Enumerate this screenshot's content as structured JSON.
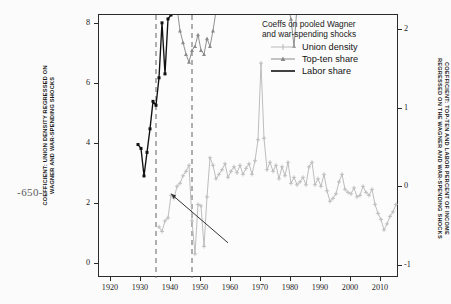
{
  "folio": {
    "page_number": "-650-"
  },
  "legend": {
    "title": "Coeffs on pooled Wagner\nand war-spending shocks",
    "entries": [
      {
        "label": "Union density",
        "color": "#b9b9b9",
        "marker": "plus-marker"
      },
      {
        "label": "Top-ten share",
        "color": "#8a8a8a",
        "marker": "triangle-marker"
      },
      {
        "label": "Labor share",
        "color": "#111111",
        "marker": "line-marker"
      }
    ]
  },
  "axes": {
    "left_title": "COEFFICIENT: UNION DENSITY REGRESSED ON\nWAGNER AND WAR-SPENDING SHOCKS",
    "right_title": "COEFFICIENT: TOP-TEN AND LABOR PERCENT OF INCOME\nREGRESSED ON THE WAGNER AND WAR-SPENDING SHOCKS",
    "left_ticks": [
      "0",
      "2",
      "4",
      "6",
      "8"
    ],
    "right_ticks": [
      "-1",
      "0",
      "1",
      "2"
    ],
    "x_ticks": [
      "1920",
      "1930",
      "1940",
      "1950",
      "1960",
      "1970",
      "1980",
      "1990",
      "2000",
      "2010"
    ]
  },
  "chart_data": {
    "type": "line",
    "title": "Coeffs on pooled Wagner and war-spending shocks",
    "xlabel": "",
    "ylabel": "COEFFICIENT: UNION DENSITY REGRESSED ON WAGNER AND WAR-SPENDING SHOCKS",
    "ylabel_right": "COEFFICIENT: TOP-TEN AND LABOR PERCENT OF INCOME REGRESSED ON THE WAGNER AND WAR-SPENDING SHOCKS",
    "xlim": [
      1916,
      2016
    ],
    "ylim": [
      -0.45,
      8.3
    ],
    "ylim_right": [
      -1.15,
      2.2
    ],
    "grid": false,
    "legend_position": "top-right",
    "annotations": [
      {
        "type": "vline",
        "x": 1935,
        "style": "dashed",
        "color": "#6e6e6e"
      },
      {
        "type": "vline",
        "x": 1947,
        "style": "dashed",
        "color": "#6e6e6e"
      },
      {
        "type": "arrow",
        "x_from": 1959,
        "y_from": 0.72,
        "x_to": 1940,
        "y_to": 2.35,
        "color": "#333333"
      }
    ],
    "series": [
      {
        "name": "Top-ten share",
        "axis": "right",
        "color": "#8a8a8a",
        "marker": "triangle",
        "x": [
          1918,
          1919,
          1920,
          1921,
          1922,
          1923,
          1924,
          1925,
          1926,
          1927,
          1928,
          1929,
          1930,
          1931,
          1932,
          1933,
          1934,
          1935,
          1936,
          1937,
          1938,
          1939,
          1940,
          1941,
          1942,
          1943,
          1944,
          1945,
          1946,
          1947,
          1948,
          1949,
          1950,
          1951,
          1952,
          1953,
          1954,
          1955,
          1956,
          1957,
          1958,
          1959,
          1960,
          1961,
          1962,
          1963,
          1964,
          1965,
          1966,
          1967,
          1968,
          1969,
          1970,
          1971,
          1972,
          1973,
          1974,
          1975,
          1976,
          1977,
          1978,
          1979,
          1980,
          1981,
          1982,
          1983,
          1984,
          1985,
          1986,
          1987,
          1988,
          1989,
          1990,
          1991,
          1992,
          1993,
          1994,
          1995,
          1996,
          1997,
          1998,
          1999,
          2000,
          2001,
          2002,
          2003,
          2004,
          2005,
          2006,
          2007,
          2008,
          2009,
          2010,
          2011,
          2012,
          2013,
          2014,
          2015
        ],
        "y": [
          7.45,
          7.2,
          7.15,
          5.05,
          5.5,
          4.55,
          6.5,
          6.45,
          6.4,
          6.6,
          6.75,
          7.95,
          6.1,
          5.3,
          5.6,
          6.15,
          5.85,
          6.7,
          6.4,
          5.85,
          5.2,
          4.35,
          4.15,
          3.0,
          2.3,
          2.0,
          1.85,
          1.7,
          1.6,
          1.75,
          1.8,
          1.95,
          1.75,
          1.7,
          1.9,
          1.8,
          2.0,
          2.25,
          2.35,
          2.45,
          2.3,
          2.45,
          2.6,
          2.55,
          2.7,
          2.6,
          2.45,
          2.35,
          2.55,
          2.7,
          2.9,
          2.8,
          2.6,
          2.35,
          2.5,
          2.7,
          2.45,
          2.25,
          2.45,
          2.6,
          2.5,
          2.3,
          2.15,
          1.8,
          2.3,
          2.65,
          2.6,
          2.7,
          2.95,
          3.0,
          2.95,
          2.75,
          2.8,
          2.75,
          3.0,
          2.65,
          2.7,
          3.0,
          3.5,
          3.6,
          4.15,
          4.8,
          5.2,
          4.6,
          4.3,
          4.25,
          4.55,
          4.75,
          4.65,
          4.5,
          3.65,
          4.05,
          4.4,
          4.35,
          4.9,
          4.35,
          4.7,
          5.15
        ]
      },
      {
        "name": "Union density",
        "axis": "left",
        "color": "#b9b9b9",
        "marker": "plus",
        "x": [
          1936,
          1937,
          1938,
          1939,
          1940,
          1941,
          1942,
          1943,
          1944,
          1945,
          1946,
          1947,
          1948,
          1949,
          1950,
          1951,
          1952,
          1953,
          1954,
          1955,
          1956,
          1957,
          1958,
          1959,
          1960,
          1961,
          1962,
          1963,
          1964,
          1965,
          1966,
          1967,
          1968,
          1969,
          1970,
          1971,
          1972,
          1973,
          1974,
          1975,
          1976,
          1977,
          1978,
          1979,
          1980,
          1981,
          1982,
          1983,
          1984,
          1985,
          1986,
          1987,
          1988,
          1989,
          1990,
          1991,
          1992,
          1993,
          1994,
          1995,
          1996,
          1997,
          1998,
          1999,
          2000,
          2001,
          2002,
          2003,
          2004,
          2005,
          2006,
          2007,
          2008,
          2009,
          2010,
          2011,
          2012,
          2013,
          2014,
          2015
        ],
        "y": [
          1.25,
          1.1,
          1.45,
          1.55,
          2.3,
          2.2,
          2.6,
          2.7,
          2.95,
          3.1,
          3.3,
          1.45,
          0.35,
          2.0,
          1.95,
          0.6,
          2.25,
          3.55,
          3.3,
          2.85,
          3.0,
          3.15,
          3.35,
          2.9,
          3.1,
          3.25,
          3.05,
          3.3,
          3.0,
          3.2,
          3.35,
          3.0,
          3.45,
          4.15,
          6.7,
          4.2,
          3.15,
          3.4,
          3.1,
          3.3,
          2.85,
          3.25,
          2.95,
          3.4,
          2.7,
          2.9,
          2.65,
          2.75,
          2.9,
          2.65,
          3.25,
          3.4,
          2.65,
          2.85,
          2.6,
          3.0,
          2.45,
          2.1,
          2.2,
          2.35,
          2.75,
          3.0,
          2.5,
          2.4,
          2.35,
          2.55,
          2.25,
          2.3,
          2.6,
          2.4,
          2.3,
          2.5,
          2.0,
          1.7,
          1.5,
          1.15,
          1.35,
          1.6,
          1.75,
          2.0
        ]
      },
      {
        "name": "Labor share",
        "axis": "right",
        "color": "#111111",
        "marker": "square",
        "x": [
          1929,
          1930,
          1931,
          1932,
          1933,
          1934,
          1935,
          1936,
          1937,
          1938,
          1939,
          1940,
          1941,
          1942,
          1943,
          1944,
          1945,
          1946,
          1947,
          1948,
          1949,
          1950,
          1951,
          1952,
          1953,
          1954,
          1955,
          1956,
          1957,
          1958,
          1959,
          1960,
          1961,
          1962,
          1963,
          1964,
          1965,
          1966,
          1967,
          1968,
          1969,
          1970,
          1971,
          1972,
          1973,
          1974,
          1975,
          1976,
          1977,
          1978,
          1979,
          1980,
          1981,
          1982,
          1983,
          1984,
          1985,
          1986,
          1987,
          1988,
          1989,
          1990,
          1991,
          1992,
          1993,
          1994,
          1995,
          1996,
          1997,
          1998,
          1999,
          2000,
          2001,
          2002,
          2003,
          2004,
          2005,
          2006,
          2007,
          2008,
          2009,
          2010,
          2011,
          2012,
          2013,
          2014,
          2015
        ],
        "y": [
          0.55,
          0.5,
          0.15,
          0.45,
          0.75,
          1.1,
          1.05,
          1.4,
          2.1,
          1.45,
          2.15,
          2.2,
          2.3,
          2.75,
          3.25,
          3.8,
          4.15,
          4.0,
          4.25,
          4.35,
          4.45,
          4.3,
          4.05,
          4.15,
          4.0,
          3.85,
          3.75,
          3.85,
          3.9,
          3.8,
          3.7,
          3.75,
          3.8,
          3.85,
          3.8,
          3.75,
          3.65,
          3.7,
          3.8,
          3.85,
          3.8,
          3.85,
          3.75,
          3.65,
          3.75,
          3.9,
          3.85,
          3.75,
          3.7,
          3.65,
          3.75,
          3.85,
          3.95,
          4.15,
          4.1,
          3.95,
          3.85,
          3.95,
          4.2,
          4.1,
          3.95,
          3.9,
          3.8,
          3.75,
          3.65,
          3.6,
          3.55,
          3.6,
          3.65,
          3.8,
          3.9,
          3.85,
          3.7,
          3.55,
          3.45,
          3.35,
          3.3,
          3.25,
          3.2,
          3.15,
          3.1,
          3.0,
          2.95,
          3.05,
          3.1,
          2.85,
          2.75
        ]
      }
    ]
  }
}
